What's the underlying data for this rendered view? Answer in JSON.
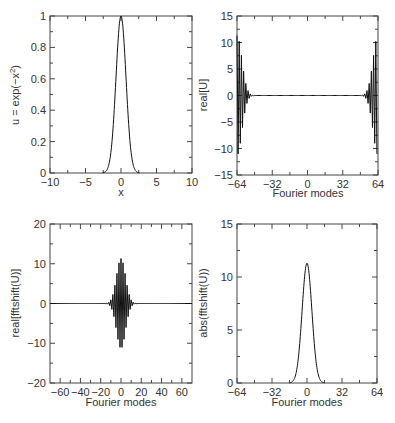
{
  "chart_data": [
    {
      "id": "top-left",
      "type": "line",
      "title": "",
      "xlabel": "x",
      "ylabel": "u = exp(−x²)",
      "xlim": [
        -10,
        10
      ],
      "ylim": [
        0,
        1
      ],
      "xticks": [
        -10,
        -5,
        0,
        5,
        10
      ],
      "yticks": [
        0,
        0.2,
        0.4,
        0.6,
        0.8,
        1
      ],
      "xtick_labels": [
        "−10",
        "−5",
        "0",
        "5",
        "10"
      ],
      "ytick_labels": [
        "0",
        "0.2",
        "0.4",
        "0.6",
        "0.8",
        "1"
      ],
      "function": "exp(-x^2)",
      "x": [
        -3,
        -2.5,
        -2,
        -1.5,
        -1,
        -0.5,
        0,
        0.5,
        1,
        1.5,
        2,
        2.5,
        3
      ],
      "values": [
        0.0001,
        0.0019,
        0.0183,
        0.1054,
        0.3679,
        0.7788,
        1.0,
        0.7788,
        0.3679,
        0.1054,
        0.0183,
        0.0019,
        0.0001
      ],
      "grid": false
    },
    {
      "id": "top-right",
      "type": "line",
      "title": "",
      "xlabel": "Fourier modes",
      "ylabel": "real[U]",
      "xlim": [
        -64,
        64
      ],
      "ylim": [
        -15,
        15
      ],
      "xticks": [
        -64,
        -32,
        0,
        32,
        64
      ],
      "yticks": [
        -15,
        -10,
        -5,
        0,
        5,
        10,
        15
      ],
      "xtick_labels": [
        "−64",
        "−32",
        "0",
        "32",
        "64"
      ],
      "ytick_labels": [
        "−15",
        "−10",
        "−5",
        "0",
        "5",
        "10",
        "15"
      ],
      "description": "Alternating-sign oscillation with envelope ~11.3 concentrated near both ends (modes -64..-52 and 52..64), zero in the middle",
      "envelope_peak": 11.3,
      "grid": false
    },
    {
      "id": "bottom-left",
      "type": "line",
      "title": "",
      "xlabel": "Fourier modes",
      "ylabel": "real[fftshift(U)]",
      "xlim": [
        -70,
        70
      ],
      "ylim": [
        -20,
        20
      ],
      "xticks": [
        -60,
        -40,
        -20,
        0,
        20,
        40,
        60
      ],
      "yticks": [
        -20,
        -10,
        0,
        10,
        20
      ],
      "xtick_labels": [
        "−60",
        "−40",
        "−20",
        "0",
        "20",
        "40",
        "60"
      ],
      "ytick_labels": [
        "−20",
        "−10",
        "0",
        "10",
        "20"
      ],
      "description": "Alternating-sign oscillation centered at 0 with Gaussian envelope, peak about ±11, extends about ±12 modes",
      "envelope_peak": 11.3,
      "grid": false
    },
    {
      "id": "bottom-right",
      "type": "line",
      "title": "",
      "xlabel": "Fourier modes",
      "ylabel": "abs(fftshift(U))",
      "xlim": [
        -64,
        64
      ],
      "ylim": [
        0,
        15
      ],
      "xticks": [
        -64,
        -32,
        0,
        32,
        64
      ],
      "yticks": [
        0,
        5,
        10,
        15
      ],
      "xtick_labels": [
        "−64",
        "−32",
        "0",
        "32",
        "64"
      ],
      "ytick_labels": [
        "0",
        "5",
        "10",
        "15"
      ],
      "x": [
        -16,
        -12,
        -8,
        -6,
        -4,
        -2,
        0,
        2,
        4,
        6,
        8,
        12,
        16
      ],
      "values": [
        0.0,
        0.0,
        0.21,
        1.2,
        4.1,
        8.8,
        11.3,
        8.8,
        4.1,
        1.2,
        0.21,
        0.0,
        0.0
      ],
      "grid": false
    }
  ],
  "labels": {
    "tl_ylabel": "u = exp(−x",
    "tl_ylabel_sup": "2",
    "tl_ylabel_end": ")",
    "tl_xlabel": "x",
    "tr_ylabel": "real[U]",
    "tr_xlabel": "Fourier modes",
    "bl_ylabel": "real[fftshift(U)]",
    "bl_xlabel": "Fourier modes",
    "br_ylabel": "abs(fftshift(U))",
    "br_xlabel": "Fourier modes"
  }
}
